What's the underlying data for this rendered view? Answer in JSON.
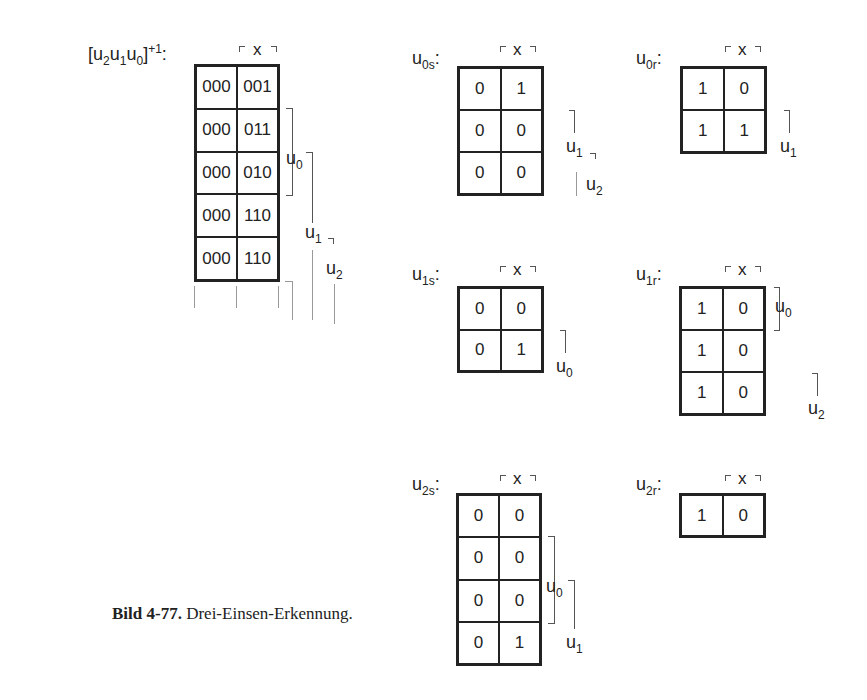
{
  "figure": {
    "caption_label": "Bild 4-77.",
    "caption_text": " Drei-Einsen-Erkennung."
  },
  "main_map": {
    "label_base": "[u",
    "label_full": "[u2u1u0]+1:",
    "column_var": "x",
    "rows": [
      [
        "000",
        "001"
      ],
      [
        "000",
        "011"
      ],
      [
        "000",
        "010"
      ],
      [
        "000",
        "110"
      ],
      [
        "000",
        "110"
      ]
    ],
    "side_labels": [
      "u0",
      "u1",
      "u2"
    ]
  },
  "maps": {
    "u0s": {
      "name": "u",
      "sub": "0s",
      "column_var": "x",
      "rows": [
        [
          "0",
          "1"
        ],
        [
          "0",
          "0"
        ],
        [
          "0",
          "0"
        ]
      ],
      "side_labels": [
        "u1",
        "u2"
      ]
    },
    "u0r": {
      "name": "u",
      "sub": "0r",
      "column_var": "x",
      "rows": [
        [
          "1",
          "0"
        ],
        [
          "1",
          "1"
        ]
      ],
      "side_labels": [
        "u1"
      ]
    },
    "u1s": {
      "name": "u",
      "sub": "1s",
      "column_var": "x",
      "rows": [
        [
          "0",
          "0"
        ],
        [
          "0",
          "1"
        ]
      ],
      "side_labels": [
        "u0"
      ]
    },
    "u1r": {
      "name": "u",
      "sub": "1r",
      "column_var": "x",
      "rows": [
        [
          "1",
          "0"
        ],
        [
          "1",
          "0"
        ],
        [
          "1",
          "0"
        ]
      ],
      "side_labels": [
        "u0",
        "u2"
      ]
    },
    "u2s": {
      "name": "u",
      "sub": "2s",
      "column_var": "x",
      "rows": [
        [
          "0",
          "0"
        ],
        [
          "0",
          "0"
        ],
        [
          "0",
          "0"
        ],
        [
          "0",
          "1"
        ]
      ],
      "side_labels": [
        "u0",
        "u1"
      ]
    },
    "u2r": {
      "name": "u",
      "sub": "2r",
      "column_var": "x",
      "rows": [
        [
          "1",
          "0"
        ]
      ],
      "side_labels": []
    }
  },
  "sub_labels": {
    "zero": "0",
    "one": "1",
    "two": "2",
    "plus_one": "+1",
    "colon": ":",
    "u": "u"
  }
}
